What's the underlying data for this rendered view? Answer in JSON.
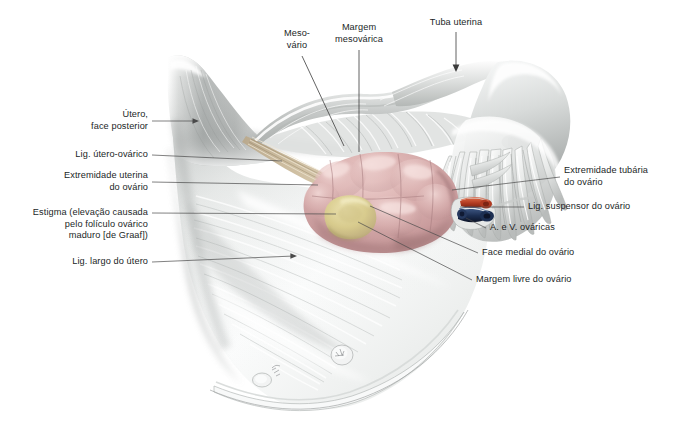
{
  "figure": {
    "background_color": "#ffffff",
    "label_color": "#221f1f",
    "leader_color": "#4a4a4a",
    "structures": {
      "uterus_posterior_face": {
        "name": "uterus-body",
        "color": "#b9bcbb"
      },
      "broad_ligament": {
        "name": "broad-ligament",
        "color": "#f2f3f3"
      },
      "ovary": {
        "name": "ovary",
        "color": "#cfa3a4"
      },
      "ovary_highlight": {
        "name": "ovary-highlight",
        "color": "#e3c0bf"
      },
      "stigma": {
        "name": "stigma-follicle",
        "color": "#d6cb8e"
      },
      "utero_ovarian_ligament": {
        "name": "utero-ovarian-ligament",
        "color": "#b8a588"
      },
      "uterine_tube": {
        "name": "uterine-tube",
        "color": "#dcdedd"
      },
      "fimbriae": {
        "name": "fimbriae",
        "color": "#eceeed"
      },
      "ovarian_artery": {
        "name": "ovarian-artery",
        "color": "#b23a22"
      },
      "ovarian_vein": {
        "name": "ovarian-vein",
        "color": "#1c2d4e"
      }
    }
  },
  "labels": {
    "top": [
      {
        "id": "mesovario",
        "text": "Meso-\nvário",
        "align": "center"
      },
      {
        "id": "margem_mesovarica",
        "text": "Margem\nmesovárica",
        "align": "center"
      },
      {
        "id": "tuba_uterina",
        "text": "Tuba uterina",
        "align": "center"
      }
    ],
    "left": [
      {
        "id": "utero_face_posterior",
        "text": "Útero,\nface posterior",
        "align": "right"
      },
      {
        "id": "lig_utero_ovarico",
        "text": "Lig. útero-ovárico",
        "align": "right"
      },
      {
        "id": "extremidade_uterina",
        "text": "Extremidade uterina\ndo ovário",
        "align": "right"
      },
      {
        "id": "estigma",
        "text": "Estigma (elevação causada\npelo folículo ovárico\nmaduro [de Graaf])",
        "align": "right"
      },
      {
        "id": "lig_largo_utero",
        "text": "Lig. largo do útero",
        "align": "right"
      }
    ],
    "right": [
      {
        "id": "extremidade_tubaria",
        "text": "Extremidade tubária\ndo ovário",
        "align": "left"
      },
      {
        "id": "lig_suspensor",
        "text": "Lig. suspensor do ovário",
        "align": "left"
      },
      {
        "id": "a_v_ovaricas",
        "text": "A. e V. ováricas",
        "align": "left"
      },
      {
        "id": "face_medial",
        "text": "Face medial do ovário",
        "align": "left"
      },
      {
        "id": "margem_livre",
        "text": "Margem livre do ovário",
        "align": "left"
      }
    ]
  }
}
